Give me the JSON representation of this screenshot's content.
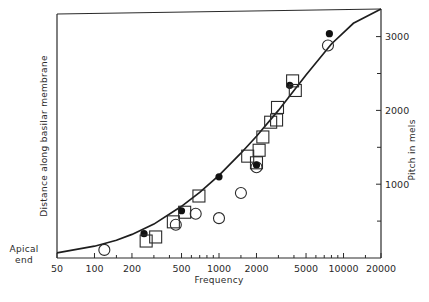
{
  "chart_data": {
    "type": "scatter",
    "title": "",
    "xlabel": "Frequency",
    "ylabel_left": "Distance along basilar membrane",
    "ylabel_right": "Pitch in mels",
    "left_axis_annotation": [
      "Apical",
      "end"
    ],
    "xscale": "log",
    "xlim": [
      50,
      20000
    ],
    "ylim_right": [
      0,
      3300
    ],
    "x_ticks_major": [
      50,
      100,
      200,
      500,
      1000,
      2000,
      5000,
      10000,
      20000
    ],
    "x_tick_labels": [
      "50",
      "100",
      "200",
      "500",
      "1000",
      "2000",
      "5000",
      "10000",
      "20000"
    ],
    "x_ticks_minor": [
      150,
      300,
      400,
      600,
      700,
      800,
      900,
      1500,
      3000,
      4000,
      6000,
      7000,
      8000,
      9000,
      15000
    ],
    "y_right_ticks_major": [
      1000,
      2000,
      3000
    ],
    "y_right_tick_labels": [
      "1000",
      "2000",
      "3000"
    ],
    "y_right_ticks_minor": [
      500,
      1500,
      2500
    ],
    "grid": false,
    "legend": null,
    "curve": {
      "name": "Mel pitch scale (fitted curve)",
      "x": [
        50,
        100,
        150,
        200,
        300,
        500,
        700,
        1000,
        1500,
        2000,
        3000,
        5000,
        8000,
        12000,
        20000
      ],
      "y": [
        70,
        160,
        240,
        320,
        460,
        700,
        890,
        1120,
        1420,
        1650,
        2000,
        2480,
        2900,
        3180,
        3340
      ]
    },
    "series": [
      {
        "name": "open circles",
        "marker": "open-circle",
        "x": [
          120,
          450,
          650,
          1000,
          1500,
          2000,
          7500
        ],
        "y": [
          110,
          450,
          600,
          540,
          880,
          1230,
          2880
        ]
      },
      {
        "name": "filled circles",
        "marker": "filled-circle",
        "x": [
          250,
          500,
          1000,
          2000,
          3700,
          7700
        ],
        "y": [
          330,
          640,
          1100,
          1260,
          2340,
          3040
        ]
      },
      {
        "name": "open squares",
        "marker": "open-square",
        "x": [
          260,
          310,
          430,
          530,
          690,
          1700,
          2000,
          2100,
          2250,
          2600,
          2900,
          2950,
          3900,
          4100
        ],
        "y": [
          230,
          285,
          490,
          620,
          840,
          1380,
          1290,
          1460,
          1640,
          1840,
          1870,
          2040,
          2400,
          2270
        ]
      }
    ],
    "plot_area_px": {
      "left": 57,
      "right": 381,
      "top_left": 14,
      "top_right": 9,
      "bottom": 258
    },
    "colors": {
      "ink": "#2a2a2a",
      "background": "#ffffff"
    }
  }
}
